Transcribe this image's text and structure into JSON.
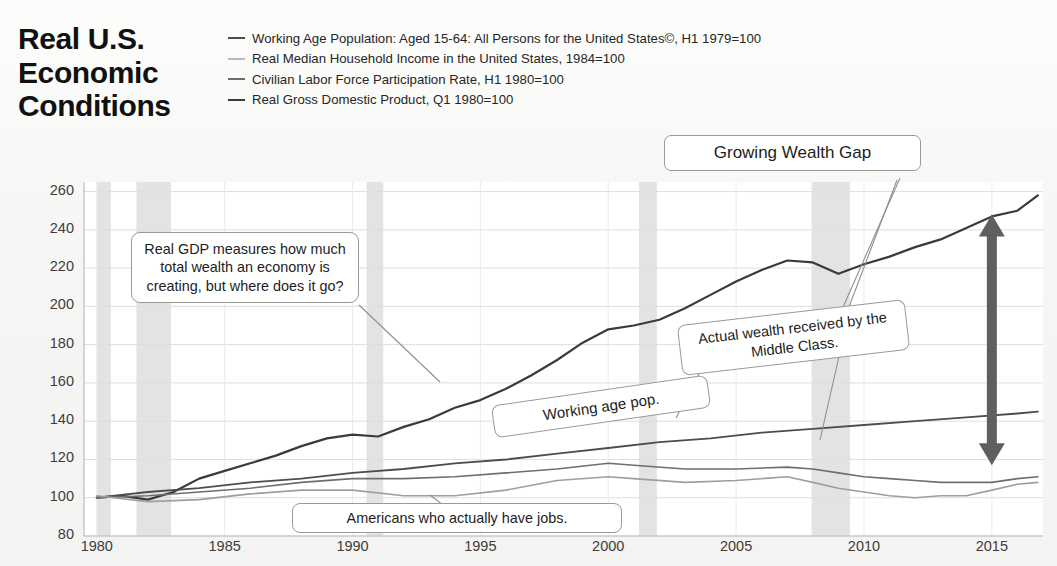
{
  "title": "Real U.S. Economic Conditions",
  "legend": {
    "position": "top",
    "items": [
      {
        "label": "Working Age Population: Aged 15-64: All Persons for the United States©, H1 1979=100",
        "color": "#4d4d4d"
      },
      {
        "label": "Real Median Household Income in the United States, 1984=100",
        "color": "#b9b9b9"
      },
      {
        "label": "Civilian Labor Force Participation Rate, H1 1980=100",
        "color": "#6e6e6e"
      },
      {
        "label": "Real Gross Domestic Product, Q1 1980=100",
        "color": "#3a3a3a"
      }
    ]
  },
  "annotations": [
    {
      "id": "gdp",
      "text": "Real GDP measures how much total wealth an economy is creating, but where does it go?"
    },
    {
      "id": "jobs",
      "text": "Americans who actually have jobs."
    },
    {
      "id": "gap",
      "text": "Growing Wealth Gap"
    },
    {
      "id": "wap",
      "text": "Working age pop."
    },
    {
      "id": "mid",
      "text": "Actual wealth received by the Middle Class."
    }
  ],
  "chart_data": {
    "type": "line",
    "title": "Real U.S. Economic Conditions",
    "xlabel": "",
    "ylabel": "Index",
    "xlim": [
      1979.5,
      2017.0
    ],
    "ylim": [
      80,
      265
    ],
    "yticks": [
      80,
      100,
      120,
      140,
      160,
      180,
      200,
      220,
      240,
      260
    ],
    "xticks": [
      1980,
      1985,
      1990,
      1995,
      2000,
      2005,
      2010,
      2015
    ],
    "grid": true,
    "grid_color": "#dedede",
    "recession_bands": [
      {
        "start": 1980.0,
        "end": 1980.55
      },
      {
        "start": 1981.55,
        "end": 1982.9
      },
      {
        "start": 1990.55,
        "end": 1991.2
      },
      {
        "start": 2001.2,
        "end": 2001.9
      },
      {
        "start": 2007.95,
        "end": 2009.45
      }
    ],
    "recession_color": "#e3e3e3",
    "arrow": {
      "label": "Growing Wealth Gap",
      "x": 2015.0,
      "y_top": 248,
      "y_bottom": 117,
      "color": "#5f5f5f"
    },
    "series": [
      {
        "name": "Real Gross Domestic Product, Q1 1980=100",
        "color": "#3a3a3a",
        "width": 2.2,
        "x": [
          1980,
          1981,
          1982,
          1983,
          1984,
          1985,
          1986,
          1987,
          1988,
          1989,
          1990,
          1991,
          1992,
          1993,
          1994,
          1995,
          1996,
          1997,
          1998,
          1999,
          2000,
          2001,
          2002,
          2003,
          2004,
          2005,
          2006,
          2007,
          2008,
          2009,
          2010,
          2011,
          2012,
          2013,
          2014,
          2015,
          2016,
          2016.8
        ],
        "values": [
          100,
          101,
          99,
          103,
          110,
          114,
          118,
          122,
          127,
          131,
          133,
          132,
          137,
          141,
          147,
          151,
          157,
          164,
          172,
          181,
          188,
          190,
          193,
          199,
          206,
          213,
          219,
          224,
          223,
          217,
          222,
          226,
          231,
          235,
          241,
          247,
          250,
          258
        ]
      },
      {
        "name": "Working Age Population: Aged 15-64: All Persons for the United States©, H1 1979=100",
        "color": "#4d4d4d",
        "width": 1.8,
        "x": [
          1980,
          1982,
          1984,
          1986,
          1988,
          1990,
          1992,
          1994,
          1996,
          1998,
          2000,
          2002,
          2004,
          2006,
          2008,
          2010,
          2012,
          2014,
          2016,
          2016.8
        ],
        "values": [
          100,
          103,
          105,
          108,
          110,
          113,
          115,
          118,
          120,
          123,
          126,
          129,
          131,
          134,
          136,
          138,
          140,
          142,
          144,
          145
        ]
      },
      {
        "name": "Civilian Labor Force Participation Rate, H1 1980=100",
        "color": "#6e6e6e",
        "width": 1.6,
        "x": [
          1980,
          1982,
          1984,
          1986,
          1988,
          1990,
          1992,
          1994,
          1996,
          1998,
          2000,
          2001,
          2003,
          2005,
          2007,
          2008,
          2009,
          2010,
          2011,
          2012,
          2013,
          2014,
          2015,
          2016,
          2016.8
        ],
        "values": [
          100,
          101,
          103,
          105,
          108,
          110,
          110,
          111,
          113,
          115,
          118,
          117,
          115,
          115,
          116,
          115,
          113,
          111,
          110,
          109,
          108,
          108,
          108,
          110,
          111
        ]
      },
      {
        "name": "Real Median Household Income in the United States, 1984=100",
        "color": "#9e9e9e",
        "width": 1.6,
        "x": [
          1980,
          1982,
          1984,
          1986,
          1988,
          1990,
          1992,
          1994,
          1996,
          1998,
          2000,
          2001,
          2003,
          2005,
          2007,
          2008,
          2009,
          2010,
          2011,
          2012,
          2013,
          2014,
          2015,
          2016,
          2016.8
        ],
        "values": [
          101,
          98,
          99,
          102,
          104,
          104,
          101,
          101,
          104,
          109,
          111,
          110,
          108,
          109,
          111,
          108,
          105,
          103,
          101,
          100,
          101,
          101,
          104,
          107,
          108
        ]
      }
    ]
  }
}
